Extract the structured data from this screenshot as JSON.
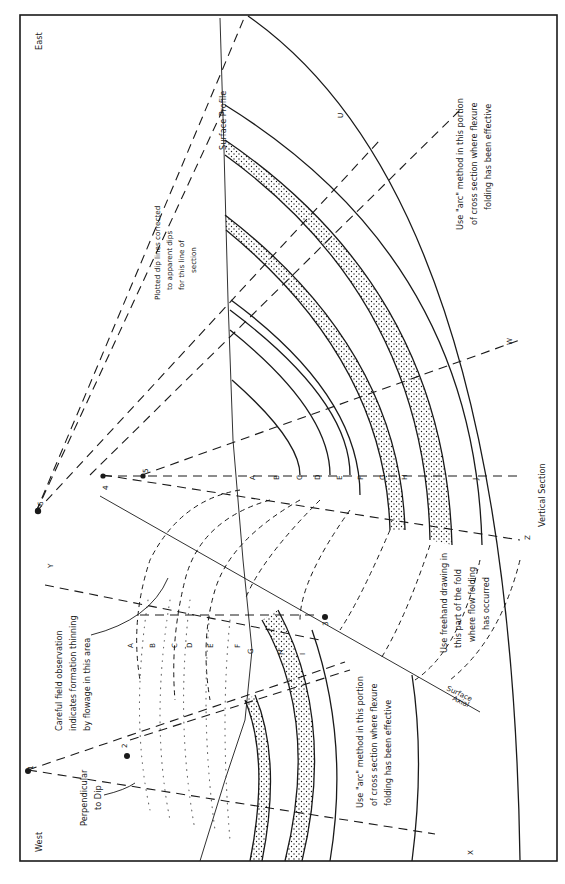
{
  "figure": {
    "type": "geologic cross-section construction",
    "orientation": "rotated 90 degrees counter-clockwise",
    "colors": {
      "ink": "#1a1a1a",
      "background": "#ffffff",
      "stipple": "#1a1a1a"
    }
  },
  "directions": {
    "east": "East",
    "west": "West"
  },
  "section_labels": {
    "surface_profile": "Surface Profile",
    "vertical_section": "Vertical Section",
    "axial_surface_1": "Axial",
    "axial_surface_2": "Surface"
  },
  "focus_points": [
    "1",
    "2",
    "3",
    "4",
    "5",
    "6"
  ],
  "dip_line_labels": {
    "U": "U",
    "W": "W",
    "Z": "Z",
    "Y": "Y",
    "X": "X"
  },
  "east_limb_beds": [
    "A",
    "B",
    "C",
    "D",
    "E",
    "F",
    "G",
    "H",
    "J"
  ],
  "west_limb_beds": [
    "A",
    "B",
    "C",
    "D",
    "E",
    "F",
    "G",
    "H",
    "I"
  ],
  "annotations": {
    "plotted_dip": [
      "Plotted dip lines corrected",
      "to apparent dips",
      "for this line of",
      "section"
    ],
    "arc_east": [
      "Use \"arc\" method in this portion",
      "of cross section where flexure",
      "folding has been effective"
    ],
    "arc_west": [
      "Use \"arc\" method in this portion",
      "of cross section where flexure",
      "folding has been effective"
    ],
    "freehand": [
      "Use freehand drawing in",
      "this part of the fold",
      "where flow folding",
      "has occurred"
    ],
    "field_obs": [
      "Careful field observation",
      "indicates formation thinning",
      "by flowage in this area"
    ],
    "perpendicular": [
      "Perpendicular",
      "to Dip"
    ]
  }
}
